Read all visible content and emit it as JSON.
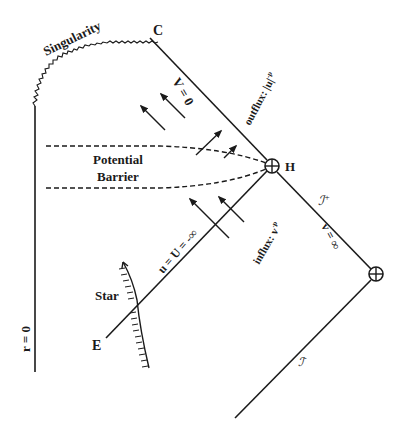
{
  "diagram": {
    "type": "Penrose diagram",
    "labels": {
      "singularity": "Singularity",
      "corner_c": "C",
      "v_zero": "V = 0",
      "outflux": "outflux: |u|",
      "outflux_exp": "-p",
      "potential": "Potential",
      "barrier": "Barrier",
      "horizon": "H",
      "scri_plus": "ℐ",
      "scri_plus_sup": "+",
      "v_infinity": "v = ∞",
      "influx": "influx: v",
      "influx_exp": "-p",
      "u_line": "u = U = -∞",
      "star": "Star",
      "event_e": "E",
      "r_zero": "r = 0",
      "scri_minus": "ℐ",
      "scri_minus_sup": "-"
    },
    "colors": {
      "stroke": "#1a1a1a",
      "background": "#ffffff"
    }
  }
}
